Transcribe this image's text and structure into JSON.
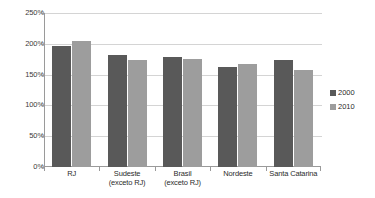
{
  "chart_data": {
    "type": "bar",
    "title": "",
    "subtitle": "",
    "xlabel": "",
    "ylabel": "",
    "categories": [
      "RJ",
      "Sudeste\n(exceto RJ)",
      "Brasil\n(exceto RJ)",
      "Nordeste",
      "Santa Catarina"
    ],
    "category_lines": [
      [
        "RJ"
      ],
      [
        "Sudeste",
        "(exceto RJ)"
      ],
      [
        "Brasil",
        "(exceto RJ)"
      ],
      [
        "Nordeste"
      ],
      [
        "Santa Catarina"
      ]
    ],
    "series": [
      {
        "name": "2000",
        "color": "#595959",
        "values": [
          197,
          182,
          179,
          162,
          173
        ]
      },
      {
        "name": "2010",
        "color": "#9d9d9d",
        "values": [
          204,
          173,
          176,
          168,
          158
        ]
      }
    ],
    "ylim": [
      0,
      250
    ],
    "ytick_values": [
      250,
      200,
      150,
      100,
      50,
      0
    ],
    "ytick_labels": [
      "250%",
      "200%",
      "150%",
      "100%",
      "50%",
      "0%"
    ],
    "grid": true,
    "grid_axis": "y",
    "legend_position": "right",
    "value_unit": "%"
  },
  "legend": {
    "entries": [
      {
        "label": "2000",
        "color": "#595959"
      },
      {
        "label": "2010",
        "color": "#9d9d9d"
      }
    ]
  },
  "colors": {
    "series_2000": "#595959",
    "series_2010": "#9d9d9d",
    "gridline": "#d4d4d4",
    "axis": "#9a9a9a",
    "text": "#2b2b2b",
    "background": "#ffffff"
  }
}
